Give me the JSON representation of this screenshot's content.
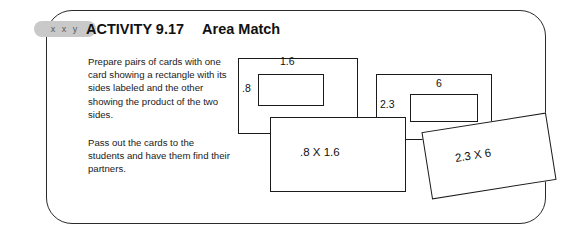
{
  "activity": {
    "tab_label": "x x y",
    "number": "ACTIVITY 9.17",
    "title": "Area Match",
    "paragraphs": [
      "Prepare pairs of cards with one card showing a rectangle with its sides labeled and the other showing the product of the two sides.",
      "Pass out the cards to the students and have them find their partners."
    ]
  },
  "figures": {
    "card_a": {
      "name": "rectangle-card-1",
      "top_label": "1.6",
      "left_label": ".8"
    },
    "card_b": {
      "name": "rectangle-card-2",
      "top_label": "6",
      "left_label": "2.3"
    },
    "card_c": {
      "name": "product-card-1",
      "label": ".8 X 1.6"
    },
    "card_d": {
      "name": "product-card-2",
      "label": "2.3 X 6"
    }
  },
  "colors": {
    "border": "#1b1b1b",
    "tab": "#c9c9c9",
    "text": "#111111",
    "background": "#ffffff"
  }
}
